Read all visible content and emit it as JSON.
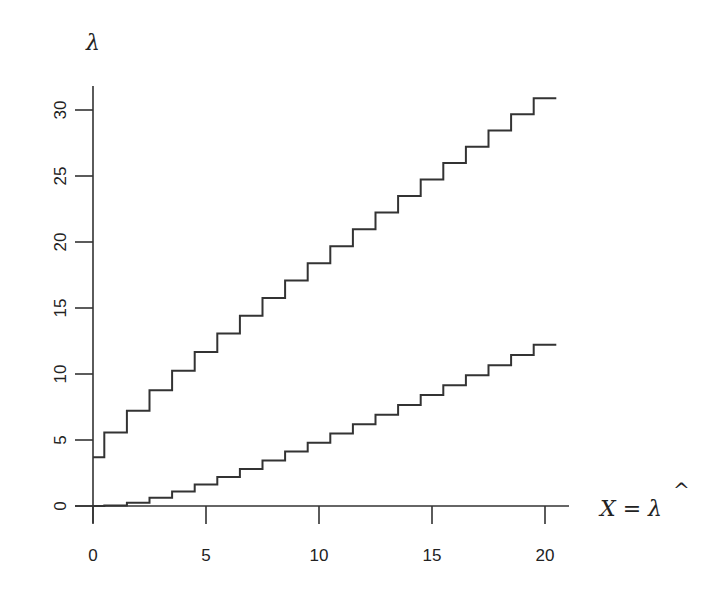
{
  "chart_data": {
    "type": "line",
    "subtype": "step",
    "title": "",
    "xlabel": "X = λ̂",
    "ylabel": "λ",
    "xlim": [
      0,
      21
    ],
    "ylim": [
      0,
      32
    ],
    "xticks": [
      0,
      5,
      10,
      15,
      20
    ],
    "yticks": [
      0,
      5,
      10,
      15,
      20,
      25,
      30
    ],
    "xtick_labels": [
      "0",
      "5",
      "10",
      "15",
      "20"
    ],
    "ytick_labels": [
      "0",
      "5",
      "10",
      "15",
      "20",
      "25",
      "30"
    ],
    "grid": false,
    "legend": null,
    "x": [
      0,
      1,
      2,
      3,
      4,
      5,
      6,
      7,
      8,
      9,
      10,
      11,
      12,
      13,
      14,
      15,
      16,
      17,
      18,
      19,
      20
    ],
    "series": [
      {
        "name": "upper",
        "values": [
          3.69,
          5.57,
          7.22,
          8.77,
          10.24,
          11.67,
          13.06,
          14.42,
          15.76,
          17.08,
          18.39,
          19.68,
          20.96,
          22.23,
          23.49,
          24.74,
          25.98,
          27.22,
          28.45,
          29.67,
          30.89
        ]
      },
      {
        "name": "lower",
        "values": [
          0,
          0.03,
          0.24,
          0.62,
          1.09,
          1.62,
          2.2,
          2.81,
          3.45,
          4.12,
          4.8,
          5.49,
          6.2,
          6.92,
          7.65,
          8.4,
          9.15,
          9.9,
          10.67,
          11.44,
          12.22
        ]
      }
    ]
  },
  "labels": {
    "y_axis_title": "λ",
    "x_axis_title_main": "X = λ",
    "x_axis_title_hat": "^"
  },
  "colors": {
    "line": "#333333",
    "background": "#ffffff"
  }
}
